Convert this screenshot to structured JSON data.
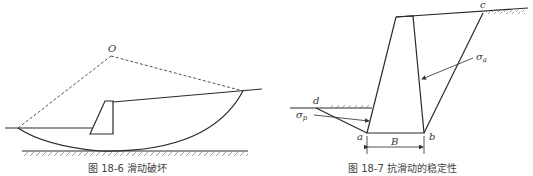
{
  "figure_left": {
    "caption": "图 18-6    滑动破坏",
    "center_label": "O"
  },
  "figure_right": {
    "caption": "图 18-7    抗滑动的稳定性",
    "labels": {
      "a": "a",
      "b": "b",
      "c": "c",
      "d": "d",
      "B": "B",
      "sigma_a": "σ",
      "sigma_a_sub": "a",
      "sigma_p": "σ",
      "sigma_p_sub": "p"
    }
  }
}
